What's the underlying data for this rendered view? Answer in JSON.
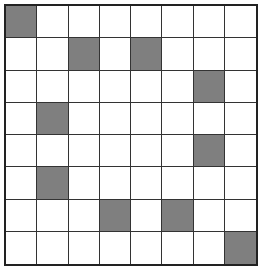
{
  "grid": {
    "rows": 8,
    "cols": 8,
    "shade_color": "#7f7f7f",
    "shaded_cells": [
      [
        0,
        0
      ],
      [
        1,
        2
      ],
      [
        1,
        4
      ],
      [
        2,
        6
      ],
      [
        3,
        1
      ],
      [
        4,
        6
      ],
      [
        5,
        1
      ],
      [
        6,
        3
      ],
      [
        6,
        5
      ],
      [
        7,
        7
      ]
    ]
  }
}
